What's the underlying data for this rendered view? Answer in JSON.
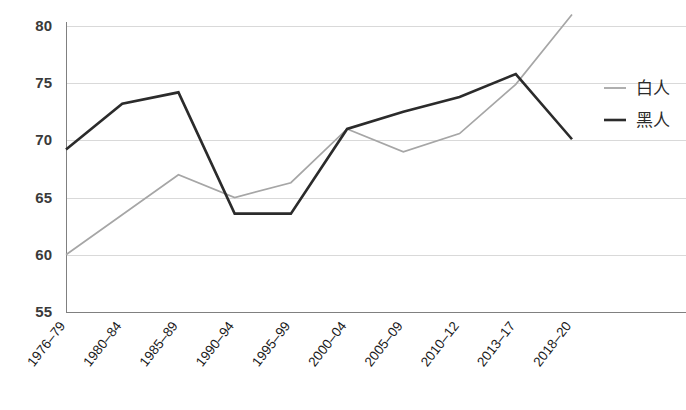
{
  "chart_data": {
    "type": "line",
    "title": "",
    "subtitle": "",
    "xlabel": "",
    "ylabel": "",
    "ylim": [
      55,
      80
    ],
    "ytick_values": [
      80,
      75,
      70,
      65,
      60,
      55
    ],
    "ytick_labels": [
      "80",
      "75",
      "70",
      "65",
      "60",
      "55"
    ],
    "grid": "horizontal",
    "legend_position": "right",
    "categories": [
      "1976–79",
      "1980–84",
      "1985–89",
      "1990–94",
      "1995–99",
      "2000–04",
      "2005–09",
      "2010–12",
      "2013–17",
      "2018–20"
    ],
    "series": [
      {
        "name": "白人",
        "color": "#a6a6a6",
        "values": [
          60.0,
          63.5,
          67.0,
          65.0,
          66.3,
          71.0,
          69.0,
          70.6,
          74.9,
          81.0
        ]
      },
      {
        "name": "黑人",
        "color": "#2b2b2b",
        "values": [
          69.2,
          73.2,
          74.2,
          63.6,
          63.6,
          71.0,
          72.5,
          73.8,
          75.8,
          70.1
        ]
      }
    ]
  },
  "legend": {
    "entries": [
      {
        "label": "白人",
        "color": "#a6a6a6"
      },
      {
        "label": "黑人",
        "color": "#2b2b2b"
      }
    ]
  },
  "axes": {
    "y_axis_color": "#808080",
    "x_axis_color": "#808080",
    "gridline_color": "#d9d9d9"
  }
}
